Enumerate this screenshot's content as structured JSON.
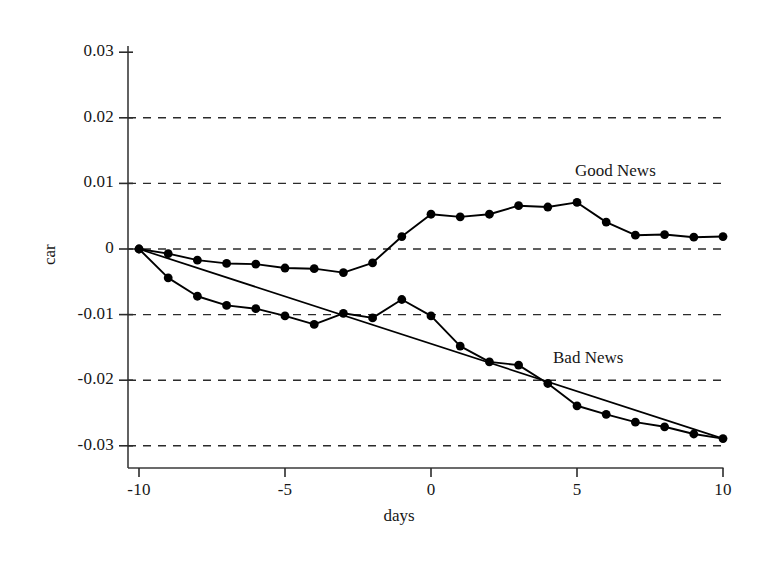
{
  "chart_data": {
    "type": "line",
    "title": "",
    "xlabel": "days",
    "ylabel": "car",
    "xlim": [
      -10,
      10
    ],
    "ylim": [
      -0.03,
      0.03
    ],
    "xticks": [
      -10,
      -5,
      0,
      5,
      10
    ],
    "xtick_labels": [
      "-10",
      "-5",
      "0",
      "5",
      "10"
    ],
    "yticks": [
      0.03,
      0.02,
      0.01,
      0,
      -0.01,
      -0.02,
      -0.03
    ],
    "ytick_labels": [
      "0.03",
      "0.02",
      "0.01",
      "0",
      "-0.01",
      "-0.02",
      "-0.03"
    ],
    "grid": "horizontal-dashed",
    "gridlines_at": [
      0.02,
      0.01,
      0,
      -0.01,
      -0.02,
      -0.03
    ],
    "legend_position": "inline-annotations",
    "marker": "filled-circle",
    "line_color": "#000000",
    "x": [
      -10,
      -9,
      -8,
      -7,
      -6,
      -5,
      -4,
      -3,
      -2,
      -1,
      0,
      1,
      2,
      3,
      4,
      5,
      6,
      7,
      8,
      9,
      10
    ],
    "series": [
      {
        "name": "Good News",
        "annotation": "Good News",
        "values": [
          0.0,
          -0.0007,
          -0.0017,
          -0.0022,
          -0.0023,
          -0.0029,
          -0.003,
          -0.0036,
          -0.0021,
          0.0019,
          0.0053,
          0.0049,
          0.0053,
          0.0066,
          0.0064,
          0.0071,
          0.0041,
          0.0021,
          0.0022,
          0.0018,
          0.0019
        ]
      },
      {
        "name": "Bad News",
        "annotation": "Bad News",
        "values": [
          0.0,
          -0.0044,
          -0.0072,
          -0.0086,
          -0.0091,
          -0.0102,
          -0.0115,
          -0.0098,
          -0.0105,
          -0.0077,
          -0.0102,
          -0.0148,
          -0.0172,
          -0.0177,
          -0.0205,
          -0.0239,
          -0.0252,
          -0.0264,
          -0.0271,
          -0.0282,
          -0.0289
        ]
      },
      {
        "name": "Bad News trend line",
        "annotation": "",
        "type": "trendline",
        "endpoints": [
          [
            -10,
            0.0
          ],
          [
            10,
            -0.0289
          ]
        ]
      }
    ]
  },
  "annotations": {
    "good_news": "Good News",
    "bad_news": "Bad News"
  },
  "axes": {
    "x_title": "days",
    "y_title": "car"
  }
}
